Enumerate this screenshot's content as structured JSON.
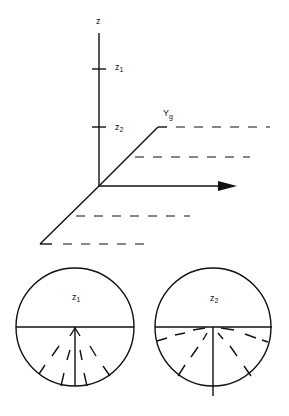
{
  "axes": {
    "z_label": "z",
    "z1_label": "z",
    "z1_sub": "1",
    "z2_label": "z",
    "z2_sub": "2",
    "y_label": "Y",
    "y_sub": "g"
  },
  "circles": [
    {
      "label": "z",
      "sub": "1"
    },
    {
      "label": "z",
      "sub": "2"
    }
  ]
}
